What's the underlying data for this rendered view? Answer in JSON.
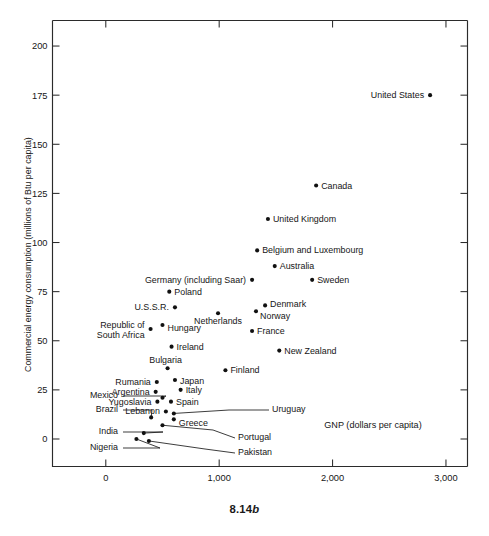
{
  "figure": {
    "caption_number": "8.14",
    "caption_letter": "b"
  },
  "chart_data": {
    "type": "scatter",
    "title": "",
    "xlabel": "GNP (dollars per capita)",
    "ylabel": "Commercial energy consumption (millions of Btu per capita)",
    "xlim": [
      -470,
      3190
    ],
    "ylim": [
      -14,
      213
    ],
    "xticks": [
      0,
      1000,
      2000,
      3000
    ],
    "xticklabels": [
      "0",
      "1,000",
      "2,000",
      "3,000"
    ],
    "yticks": [
      0,
      25,
      50,
      75,
      100,
      125,
      150,
      175,
      200
    ],
    "yticklabels": [
      "0",
      "25",
      "50",
      "75",
      "100",
      "125",
      "150",
      "175",
      "200"
    ],
    "grid": false,
    "legend": null,
    "marker_color": "#111111",
    "axis_color": "#2b2b2b",
    "points": [
      {
        "name": "United States",
        "x": 2860,
        "y": 175,
        "label_pos": "left"
      },
      {
        "name": "Canada",
        "x": 1855,
        "y": 129,
        "label_pos": "right"
      },
      {
        "name": "United Kingdom",
        "x": 1430,
        "y": 112,
        "label_pos": "right"
      },
      {
        "name": "Belgium and Luxembourg",
        "x": 1335,
        "y": 96,
        "label_pos": "right"
      },
      {
        "name": "Australia",
        "x": 1490,
        "y": 88,
        "label_pos": "right"
      },
      {
        "name": "Sweden",
        "x": 1820,
        "y": 81,
        "label_pos": "right"
      },
      {
        "name": "Germany (including Saar)",
        "x": 1290,
        "y": 81,
        "label_pos": "left"
      },
      {
        "name": "Poland",
        "x": 560,
        "y": 75,
        "label_pos": "right"
      },
      {
        "name": "U.S.S.R.",
        "x": 610,
        "y": 67,
        "label_pos": "right"
      },
      {
        "name": "Denmark",
        "x": 1405,
        "y": 68,
        "label_pos": "right"
      },
      {
        "name": "Norway",
        "x": 1325,
        "y": 65,
        "label_pos": "right"
      },
      {
        "name": "Netherlands",
        "x": 990,
        "y": 64,
        "label_pos": "below"
      },
      {
        "name": "Hungary",
        "x": 500,
        "y": 58,
        "label_pos": "right"
      },
      {
        "name": "Republic of South Africa",
        "x": 395,
        "y": 56,
        "label_pos": "left"
      },
      {
        "name": "France",
        "x": 1290,
        "y": 55,
        "label_pos": "right"
      },
      {
        "name": "Ireland",
        "x": 580,
        "y": 47,
        "label_pos": "right"
      },
      {
        "name": "New Zealand",
        "x": 1530,
        "y": 45,
        "label_pos": "right"
      },
      {
        "name": "Bulgaria",
        "x": 545,
        "y": 36,
        "label_pos": "above"
      },
      {
        "name": "Finland",
        "x": 1055,
        "y": 35,
        "label_pos": "right"
      },
      {
        "name": "Japan",
        "x": 610,
        "y": 30,
        "label_pos": "right"
      },
      {
        "name": "Rumania",
        "x": 450,
        "y": 29,
        "label_pos": "left"
      },
      {
        "name": "Italy",
        "x": 660,
        "y": 25,
        "label_pos": "right"
      },
      {
        "name": "Argentina",
        "x": 440,
        "y": 24,
        "label_pos": "left"
      },
      {
        "name": "Mexico",
        "x": 500,
        "y": 21,
        "label_pos": "leader-left"
      },
      {
        "name": "Yugoslavia",
        "x": 455,
        "y": 19,
        "label_pos": "left"
      },
      {
        "name": "Spain",
        "x": 575,
        "y": 19,
        "label_pos": "right"
      },
      {
        "name": "Lebanon",
        "x": 530,
        "y": 14,
        "label_pos": "left"
      },
      {
        "name": "Uruguay",
        "x": 600,
        "y": 13,
        "label_pos": "leader-right"
      },
      {
        "name": "Greece",
        "x": 600,
        "y": 10,
        "label_pos": "right"
      },
      {
        "name": "Brazil",
        "x": 400,
        "y": 11,
        "label_pos": "leader-left"
      },
      {
        "name": "Portugal",
        "x": 500,
        "y": 7,
        "label_pos": "leader-right"
      },
      {
        "name": "India",
        "x": 335,
        "y": 3,
        "label_pos": "leader-left"
      },
      {
        "name": "Nigeria",
        "x": 270,
        "y": 0,
        "label_pos": "leader-left"
      },
      {
        "name": "Pakistan",
        "x": 380,
        "y": -1,
        "label_pos": "leader-right"
      }
    ]
  }
}
